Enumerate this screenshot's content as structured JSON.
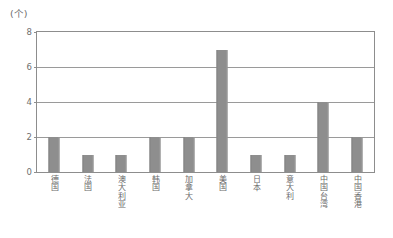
{
  "chart_data": {
    "type": "bar",
    "title": "",
    "subtitle": "",
    "unit_label": "(个)",
    "xlabel": "",
    "ylabel": "",
    "ylim": [
      0,
      8
    ],
    "yticks": [
      0,
      2,
      4,
      6,
      8
    ],
    "ytick_labels": [
      "0",
      "2",
      "4",
      "6",
      "8"
    ],
    "grid": true,
    "gridlines_at": [
      2,
      4,
      6,
      8
    ],
    "legend": null,
    "legend_position": "none",
    "categories": [
      "德国",
      "法国",
      "澳大利亚",
      "韩国",
      "加拿大",
      "美国",
      "日本",
      "意大利",
      "中国台湾",
      "中国香港"
    ],
    "values": [
      2,
      1,
      1,
      2,
      2,
      7,
      1,
      1,
      4,
      2
    ],
    "bar_color": "#8e8e8e",
    "axis_color": "#8d8d8d",
    "text_color": "#6b6b6b",
    "background": "#ffffff"
  }
}
